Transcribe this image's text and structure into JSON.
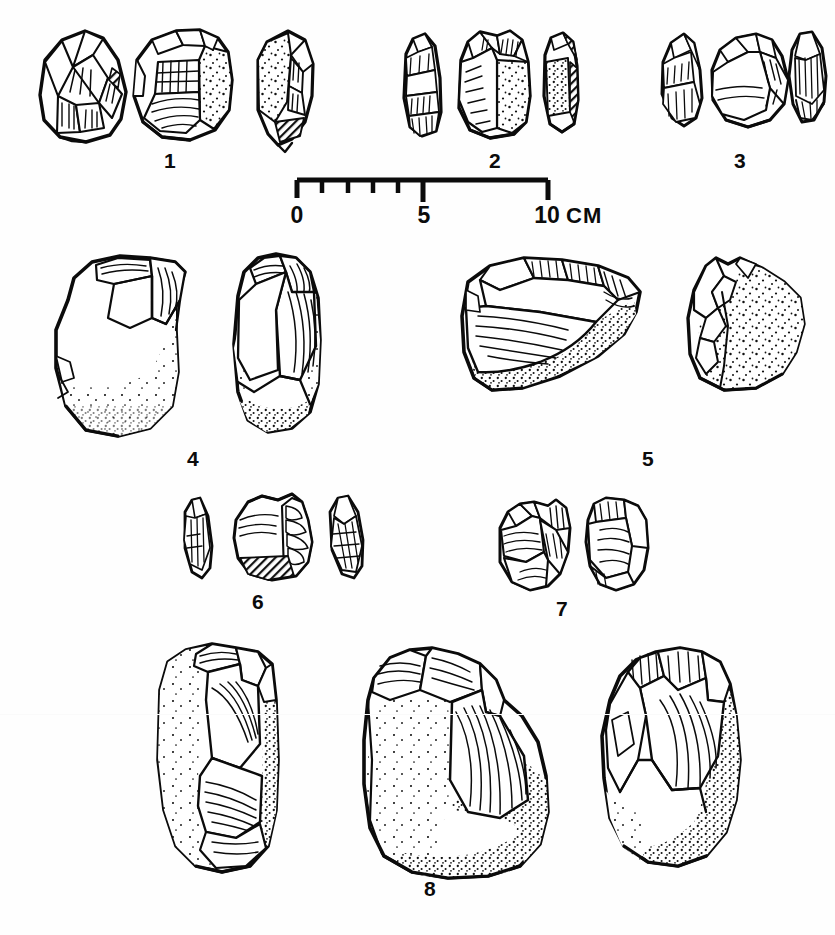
{
  "figure": {
    "type": "archaeological-lithic-plate",
    "background_color": "#fefefe",
    "ink_color": "#0b0b0b"
  },
  "scale_bar": {
    "labels": [
      "0",
      "5",
      "10"
    ],
    "unit": "CM",
    "major_ticks": [
      0,
      5,
      10
    ],
    "minor_ticks": [
      1,
      2,
      3,
      4
    ],
    "x_start_px": 297,
    "x_end_px": 548,
    "baseline_y_px": 180
  },
  "groups": [
    {
      "number": "1",
      "label_x": 170,
      "label_y": 150,
      "views": 3,
      "artifact": "retouched flake / core tool, three views"
    },
    {
      "number": "2",
      "label_x": 495,
      "label_y": 150,
      "views": 3,
      "artifact": "blade-like flake, three views"
    },
    {
      "number": "3",
      "label_x": 740,
      "label_y": 150,
      "views": 3,
      "artifact": "small flake tool, three views"
    },
    {
      "number": "4",
      "label_x": 193,
      "label_y": 448,
      "views": 2,
      "artifact": "large cortical core with flake scars, two views"
    },
    {
      "number": "5",
      "label_x": 648,
      "label_y": 448,
      "views": 2,
      "artifact": "large flake with cortex, dorsal and lateral views"
    },
    {
      "number": "6",
      "label_x": 258,
      "label_y": 591,
      "views": 3,
      "artifact": "small pointed flakes and retouched piece"
    },
    {
      "number": "7",
      "label_x": 562,
      "label_y": 598,
      "views": 2,
      "artifact": "small faceted core fragments, two views"
    },
    {
      "number": "8",
      "label_x": 430,
      "label_y": 878,
      "views": 3,
      "artifact": "large chopper / core, three views"
    }
  ]
}
